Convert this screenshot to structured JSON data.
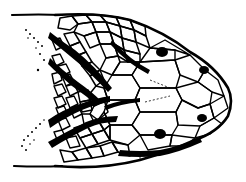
{
  "illustration": {
    "subject": "lizard head, dorsal view, scale pattern line drawing",
    "colors": {
      "ink": "#000000",
      "paper": "#ffffff"
    },
    "features": [
      "head-outline",
      "head-scales",
      "neck-scales",
      "dark-stripes",
      "eyes",
      "nostrils"
    ]
  }
}
